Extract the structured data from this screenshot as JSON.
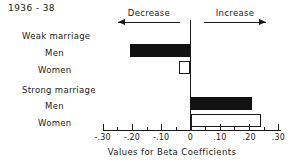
{
  "chart_data": {
    "type": "bar",
    "orientation": "horizontal",
    "title": "1936 - 38",
    "xlabel": "Values for Beta Coefficients",
    "ylabel": "",
    "xlim": [
      -0.3,
      0.3
    ],
    "grid": false,
    "legend": null,
    "zero_reference_line": 0,
    "x_ticks": [
      {
        "value": -0.3,
        "label": "-.30"
      },
      {
        "value": -0.2,
        "label": "-.20"
      },
      {
        "value": -0.1,
        "label": "-.10"
      },
      {
        "value": 0.0,
        "label": "0"
      },
      {
        "value": 0.1,
        "label": ".10"
      },
      {
        "value": 0.2,
        "label": ".20"
      },
      {
        "value": 0.3,
        "label": ".30"
      }
    ],
    "minor_ticks": [
      -0.25,
      -0.15,
      -0.05,
      0.05,
      0.15,
      0.25
    ],
    "groups": [
      {
        "name": "Weak marriage",
        "bars": [
          {
            "label": "Men",
            "value": -0.205,
            "fill": "solid"
          },
          {
            "label": "Women",
            "value": -0.04,
            "fill": "hollow"
          }
        ]
      },
      {
        "name": "Strong marriage",
        "bars": [
          {
            "label": "Men",
            "value": 0.21,
            "fill": "solid"
          },
          {
            "label": "Women",
            "value": 0.24,
            "fill": "hollow"
          }
        ]
      }
    ],
    "annotations": [
      {
        "text": "Decrease",
        "direction": "left",
        "arrow": "left-arrow"
      },
      {
        "text": "Increase",
        "direction": "right",
        "arrow": "right-arrow"
      }
    ],
    "colors": {
      "solid_bar": "#111111",
      "hollow_bar": "#ffffff",
      "outline": "#1a1a1a",
      "background": "#ffffff"
    }
  }
}
